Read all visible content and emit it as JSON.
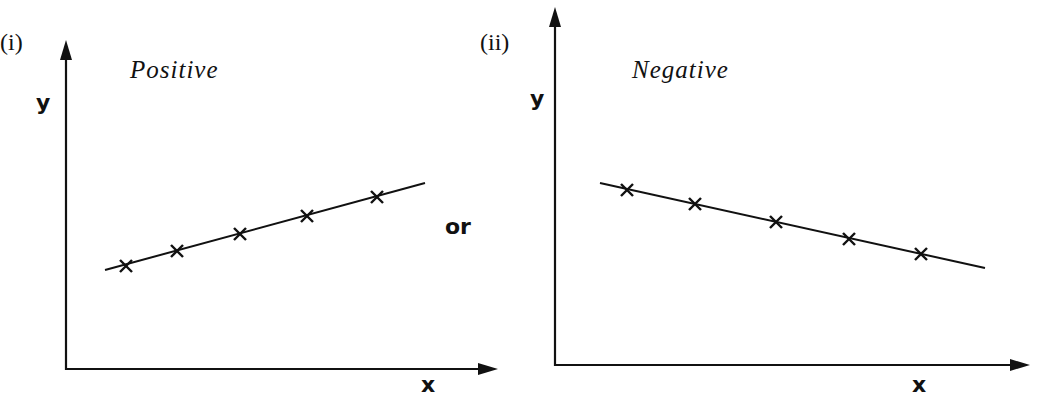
{
  "figure": {
    "separator_text": "or"
  },
  "chart_data": [
    {
      "type": "scatter",
      "panel_label": "(i)",
      "title": "Positive",
      "xlabel": "x",
      "ylabel": "y",
      "grid": false,
      "axis_ticks": false,
      "trend_line": true,
      "marker": "x",
      "description": "Points rising from left to right along a straight line (positive correlation)",
      "points_relative": [
        {
          "x": 1,
          "y": 1.0
        },
        {
          "x": 2,
          "y": 1.5
        },
        {
          "x": 3,
          "y": 2.1
        },
        {
          "x": 4,
          "y": 2.7
        },
        {
          "x": 5,
          "y": 3.4
        }
      ],
      "pixel_geometry": {
        "axis_origin": [
          66,
          369
        ],
        "y_axis_top": 40,
        "x_axis_right": 498,
        "line": [
          [
            105,
            270
          ],
          [
            425,
            183
          ]
        ],
        "markers": [
          [
            126,
            266
          ],
          [
            177,
            251
          ],
          [
            240,
            234
          ],
          [
            307,
            216
          ],
          [
            377,
            197
          ]
        ],
        "panel_label_pos": [
          0,
          50
        ],
        "title_pos": [
          130,
          78
        ],
        "ylabel_pos": [
          36,
          110
        ],
        "xlabel_pos": [
          421,
          392
        ]
      }
    },
    {
      "type": "scatter",
      "panel_label": "(ii)",
      "title": "Negative",
      "xlabel": "x",
      "ylabel": "y",
      "grid": false,
      "axis_ticks": false,
      "trend_line": true,
      "marker": "x",
      "description": "Points falling from left to right along a straight line (negative correlation)",
      "points_relative": [
        {
          "x": 1,
          "y": 3.4
        },
        {
          "x": 2,
          "y": 2.9
        },
        {
          "x": 3,
          "y": 2.3
        },
        {
          "x": 4,
          "y": 1.7
        },
        {
          "x": 5,
          "y": 1.2
        }
      ],
      "pixel_geometry": {
        "axis_origin": [
          555,
          365
        ],
        "y_axis_top": 7,
        "x_axis_right": 1030,
        "line": [
          [
            600,
            183
          ],
          [
            985,
            268
          ]
        ],
        "markers": [
          [
            627,
            190
          ],
          [
            695,
            204
          ],
          [
            776,
            222
          ],
          [
            849,
            239
          ],
          [
            921,
            254
          ]
        ],
        "panel_label_pos": [
          480,
          50
        ],
        "title_pos": [
          632,
          78
        ],
        "ylabel_pos": [
          530,
          106
        ],
        "xlabel_pos": [
          912,
          392
        ]
      }
    }
  ]
}
